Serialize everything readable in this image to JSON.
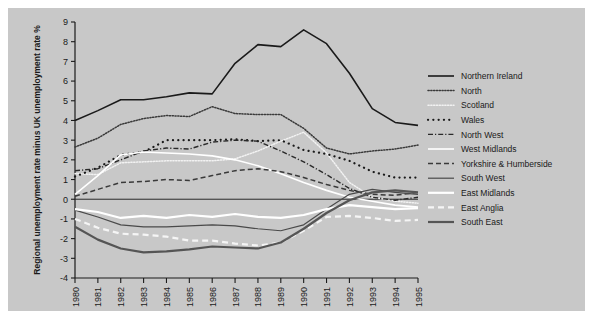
{
  "figure": {
    "background_color": "#c8c8c8",
    "page_color": "#ffffff"
  },
  "chart_data": {
    "type": "line",
    "title": "",
    "xlabel": "",
    "ylabel": "Regional unemployment rate minus UK unemployment rate %",
    "x": [
      1980,
      1981,
      1982,
      1983,
      1984,
      1985,
      1986,
      1987,
      1988,
      1989,
      1990,
      1991,
      1992,
      1993,
      1994,
      1995
    ],
    "xticklabels": [
      "1980",
      "1981",
      "1982",
      "1983",
      "1984",
      "1985",
      "1986",
      "1987",
      "1988",
      "1989",
      "1990",
      "1991",
      "1992",
      "1993",
      "1994",
      "1995"
    ],
    "yticklabels": [
      "9",
      "8",
      "7",
      "6",
      "5",
      "4",
      "3",
      "2",
      "1",
      "0",
      "-1",
      "-2",
      "-3",
      "-4"
    ],
    "ylim": [
      -4,
      9
    ],
    "xlim": [
      1980,
      1995
    ],
    "grid": false,
    "legend_position": "right",
    "zero_line": true,
    "series": [
      {
        "name": "Northern Ireland",
        "color": "#1a1a1a",
        "style": "solid",
        "width": 1.6,
        "values": [
          4.0,
          4.5,
          5.05,
          5.05,
          5.2,
          5.4,
          5.35,
          6.9,
          7.85,
          7.75,
          8.6,
          7.9,
          6.4,
          4.6,
          3.9,
          3.75
        ]
      },
      {
        "name": "North",
        "color": "#3a3a3a",
        "style": "dotted-fine",
        "width": 1.5,
        "values": [
          2.65,
          3.1,
          3.8,
          4.1,
          4.25,
          4.2,
          4.7,
          4.35,
          4.3,
          4.3,
          3.6,
          2.6,
          2.3,
          2.45,
          2.55,
          2.75
        ]
      },
      {
        "name": "Scotland",
        "color": "#f2f2f2",
        "style": "dotted-fine",
        "width": 1.5,
        "values": [
          1.3,
          1.25,
          1.85,
          1.9,
          1.95,
          1.95,
          1.95,
          2.05,
          2.45,
          2.95,
          3.4,
          2.35,
          0.85,
          0.1,
          -0.1,
          -0.2
        ]
      },
      {
        "name": "Wales",
        "color": "#1a1a1a",
        "style": "sparse-dot",
        "width": 2.2,
        "values": [
          1.15,
          1.6,
          2.25,
          2.4,
          3.0,
          3.0,
          3.0,
          3.05,
          2.95,
          3.0,
          2.5,
          2.3,
          1.95,
          1.4,
          1.1,
          1.1
        ]
      },
      {
        "name": "North West",
        "color": "#2a2a2a",
        "style": "dashdot",
        "width": 1.4,
        "values": [
          1.45,
          1.55,
          2.0,
          2.45,
          2.6,
          2.55,
          2.9,
          3.0,
          2.95,
          2.45,
          1.9,
          1.25,
          0.55,
          0.1,
          -0.05,
          0.1
        ]
      },
      {
        "name": "West Midlands",
        "color": "#ffffff",
        "style": "solid",
        "width": 1.6,
        "values": [
          0.25,
          1.2,
          2.25,
          2.4,
          2.35,
          2.3,
          2.2,
          2.0,
          1.7,
          1.3,
          0.85,
          0.45,
          0.1,
          -0.1,
          -0.3,
          -0.4
        ]
      },
      {
        "name": "Yorkshire & Humberside",
        "color": "#3a3a3a",
        "style": "dashed",
        "width": 1.5,
        "values": [
          0.15,
          0.5,
          0.85,
          0.9,
          1.0,
          0.95,
          1.2,
          1.45,
          1.55,
          1.4,
          1.1,
          0.75,
          0.45,
          0.25,
          0.2,
          0.35
        ]
      },
      {
        "name": "South West",
        "color": "#4a4a4a",
        "style": "solid",
        "width": 1.2,
        "values": [
          -0.55,
          -0.9,
          -1.3,
          -1.4,
          -1.4,
          -1.35,
          -1.3,
          -1.35,
          -1.5,
          -1.6,
          -1.3,
          -0.5,
          0.25,
          0.5,
          0.35,
          0.25
        ]
      },
      {
        "name": "East Midlands",
        "color": "#ffffff",
        "style": "solid",
        "width": 2.2,
        "values": [
          -0.5,
          -0.65,
          -0.95,
          -0.85,
          -0.95,
          -0.8,
          -0.9,
          -0.75,
          -0.9,
          -0.95,
          -0.8,
          -0.5,
          -0.3,
          -0.4,
          -0.5,
          -0.45
        ]
      },
      {
        "name": "East Anglia",
        "color": "#f5f5f5",
        "style": "dashed-thick",
        "width": 2.2,
        "values": [
          -1.0,
          -1.45,
          -1.75,
          -1.8,
          -1.9,
          -2.1,
          -2.1,
          -2.25,
          -2.35,
          -2.2,
          -1.6,
          -0.9,
          -0.85,
          -0.95,
          -1.1,
          -1.05
        ]
      },
      {
        "name": "South East",
        "color": "#555555",
        "style": "solid",
        "width": 2.2,
        "values": [
          -1.4,
          -2.05,
          -2.5,
          -2.7,
          -2.65,
          -2.55,
          -2.4,
          -2.45,
          -2.5,
          -2.2,
          -1.5,
          -0.7,
          -0.05,
          0.35,
          0.45,
          0.35
        ]
      }
    ]
  }
}
